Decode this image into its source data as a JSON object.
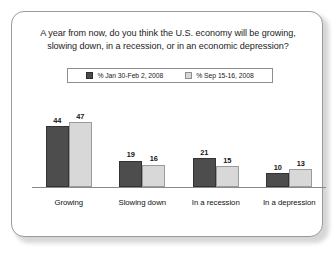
{
  "chart_data": {
    "type": "bar",
    "title": "A year from now, do you think the U.S. economy will be growing, slowing down, in a recession, or in an economic depression?",
    "title_line1": "A year from now, do you think the U.S. economy will be growing,",
    "title_line2": "slowing down, in a recession, or in an economic depression?",
    "xlabel": "",
    "ylabel": "",
    "ylim": [
      0,
      50
    ],
    "grid": false,
    "legend_position": "top-center",
    "categories": [
      "Growing",
      "Slowing down",
      "In a recession",
      "In a depression"
    ],
    "series": [
      {
        "name": "% Jan 30-Feb 2, 2008",
        "color": "#4d4d4d",
        "values": [
          44,
          19,
          21,
          10
        ]
      },
      {
        "name": "% Sep 15-16, 2008",
        "color": "#d8d8d8",
        "values": [
          47,
          16,
          15,
          13
        ]
      }
    ]
  },
  "legend": {
    "items": [
      {
        "label": "% Jan 30-Feb 2, 2008"
      },
      {
        "label": "% Sep 15-16, 2008"
      }
    ]
  }
}
